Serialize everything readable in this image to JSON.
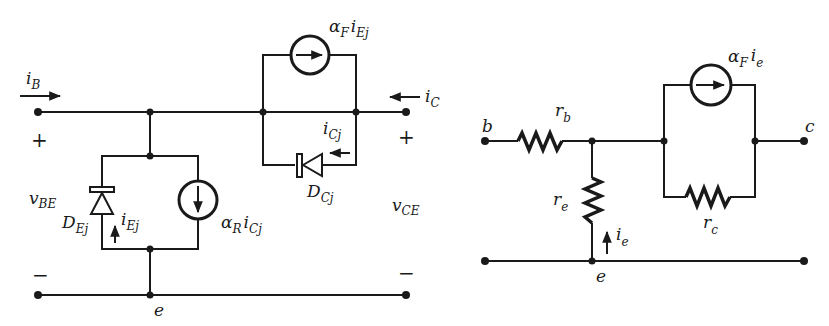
{
  "left_circuit": {
    "title": "Ebers-Moll large-signal model",
    "labels": {
      "iB": {
        "main": "i",
        "sub": "B"
      },
      "iC": {
        "main": "i",
        "sub": "C"
      },
      "vBE": {
        "main": "v",
        "sub": "BE"
      },
      "vCE": {
        "main": "v",
        "sub": "CE"
      },
      "plus_left": "+",
      "minus_left": "−",
      "plus_right": "+",
      "minus_right": "−",
      "node_e": "e",
      "DEj": {
        "main": "D",
        "sub": "Ej"
      },
      "iEj": {
        "main": "i",
        "sub": "Ej"
      },
      "alphaR_iCj": {
        "alpha": "α",
        "alpha_sub": "R",
        "main": "i",
        "sub": "Cj"
      },
      "alphaF_iEj": {
        "alpha": "α",
        "alpha_sub": "F",
        "main": "i",
        "sub": "Ej"
      },
      "iCj": {
        "main": "i",
        "sub": "Cj"
      },
      "DCj": {
        "main": "D",
        "sub": "Cj"
      }
    },
    "components": [
      {
        "type": "diode",
        "name": "D_Ej",
        "orientation": "anode-bottom, cathode-top"
      },
      {
        "type": "current-source",
        "name": "alpha_R i_Cj",
        "direction": "down"
      },
      {
        "type": "current-source",
        "name": "alpha_F i_Ej",
        "direction": "right"
      },
      {
        "type": "diode",
        "name": "D_Cj",
        "orientation": "anode-right, cathode-left"
      }
    ]
  },
  "right_circuit": {
    "title": "T-model small-signal equivalent",
    "labels": {
      "node_b": "b",
      "node_c": "c",
      "node_e": "e",
      "rb": {
        "main": "r",
        "sub": "b"
      },
      "re": {
        "main": "r",
        "sub": "e"
      },
      "rc": {
        "main": "r",
        "sub": "c"
      },
      "ie": {
        "main": "i",
        "sub": "e"
      },
      "alphaF_ie": {
        "alpha": "α",
        "alpha_sub": "F",
        "main": "i",
        "sub": "e"
      }
    },
    "components": [
      {
        "type": "resistor",
        "name": "r_b",
        "orientation": "horizontal"
      },
      {
        "type": "resistor",
        "name": "r_e",
        "orientation": "vertical"
      },
      {
        "type": "resistor",
        "name": "r_c",
        "orientation": "horizontal"
      },
      {
        "type": "current-source",
        "name": "alpha_F i_e",
        "direction": "right"
      }
    ]
  }
}
